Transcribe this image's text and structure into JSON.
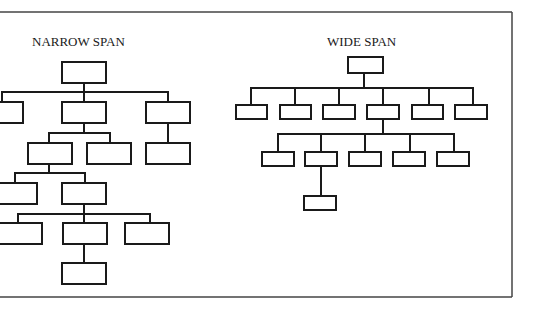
{
  "colors": {
    "background": "#ffffff",
    "stroke": "#1a1a1a",
    "frame": "#444444"
  },
  "diagram": {
    "narrow": {
      "title": "NARROW SPAN",
      "title_pos": [
        32,
        46
      ],
      "boxes": [
        [
          62,
          62,
          44,
          21
        ],
        [
          -10,
          102,
          33,
          21
        ],
        [
          62,
          102,
          44,
          21
        ],
        [
          146,
          102,
          44,
          21
        ],
        [
          28,
          143,
          44,
          21
        ],
        [
          87,
          143,
          44,
          21
        ],
        [
          146,
          143,
          44,
          21
        ],
        [
          -10,
          183,
          47,
          21
        ],
        [
          62,
          183,
          44,
          21
        ],
        [
          -10,
          223,
          52,
          21
        ],
        [
          63,
          223,
          44,
          21
        ],
        [
          125,
          223,
          44,
          21
        ],
        [
          62,
          263,
          44,
          21
        ]
      ],
      "lines": [
        [
          84,
          83,
          84,
          92
        ],
        [
          2,
          92,
          168,
          92
        ],
        [
          2,
          92,
          2,
          102
        ],
        [
          84,
          92,
          84,
          102
        ],
        [
          168,
          92,
          168,
          102
        ],
        [
          84,
          123,
          84,
          133
        ],
        [
          49,
          133,
          110,
          133
        ],
        [
          49,
          133,
          49,
          143
        ],
        [
          110,
          133,
          110,
          143
        ],
        [
          168,
          123,
          168,
          143
        ],
        [
          49,
          164,
          49,
          173
        ],
        [
          15,
          173,
          85,
          173
        ],
        [
          15,
          173,
          15,
          183
        ],
        [
          85,
          173,
          85,
          183
        ],
        [
          84,
          204,
          84,
          214
        ],
        [
          18,
          214,
          150,
          214
        ],
        [
          18,
          214,
          18,
          223
        ],
        [
          84,
          214,
          84,
          223
        ],
        [
          150,
          214,
          150,
          223
        ],
        [
          84,
          244,
          84,
          263
        ]
      ]
    },
    "wide": {
      "title": "WIDE SPAN",
      "title_pos": [
        327,
        46
      ],
      "boxes": [
        [
          348,
          57,
          35,
          16
        ],
        [
          236,
          105,
          31,
          14
        ],
        [
          280,
          105,
          31,
          14
        ],
        [
          323,
          105,
          32,
          14
        ],
        [
          367,
          105,
          32,
          14
        ],
        [
          412,
          105,
          31,
          14
        ],
        [
          455,
          105,
          32,
          14
        ],
        [
          262,
          152,
          32,
          14
        ],
        [
          305,
          152,
          32,
          14
        ],
        [
          349,
          152,
          32,
          14
        ],
        [
          393,
          152,
          32,
          14
        ],
        [
          437,
          152,
          32,
          14
        ],
        [
          304,
          196,
          32,
          14
        ]
      ],
      "lines": [
        [
          364,
          73,
          364,
          88
        ],
        [
          251,
          88,
          473,
          88
        ],
        [
          251,
          88,
          251,
          105
        ],
        [
          295,
          88,
          295,
          105
        ],
        [
          339,
          88,
          339,
          105
        ],
        [
          383,
          88,
          383,
          105
        ],
        [
          429,
          88,
          429,
          105
        ],
        [
          473,
          88,
          473,
          105
        ],
        [
          383,
          119,
          383,
          134
        ],
        [
          278,
          134,
          454,
          134
        ],
        [
          278,
          134,
          278,
          152
        ],
        [
          321,
          134,
          321,
          152
        ],
        [
          365,
          134,
          365,
          152
        ],
        [
          410,
          134,
          410,
          152
        ],
        [
          454,
          134,
          454,
          152
        ],
        [
          321,
          166,
          321,
          196
        ]
      ]
    },
    "frame": {
      "top_y": 12,
      "bottom_y": 297,
      "right_x": 512
    }
  }
}
